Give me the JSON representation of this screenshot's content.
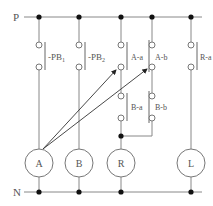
{
  "rails": {
    "top_label": "P",
    "bottom_label": "N"
  },
  "contacts": {
    "pb1": {
      "label": "PB",
      "sub": "1"
    },
    "pb2": {
      "label": "PB",
      "sub": "2"
    },
    "a_a": {
      "label": "A-a"
    },
    "a_b": {
      "label": "A-b"
    },
    "b_a": {
      "label": "B-a"
    },
    "b_b": {
      "label": "B-b"
    },
    "r_a": {
      "label": "R-a"
    }
  },
  "loads": {
    "a": {
      "label": "A"
    },
    "b": {
      "label": "B"
    },
    "r": {
      "label": "R"
    },
    "l": {
      "label": "L"
    }
  },
  "colors": {
    "line": "#777777",
    "dot": "#111111",
    "text": "#555555"
  }
}
